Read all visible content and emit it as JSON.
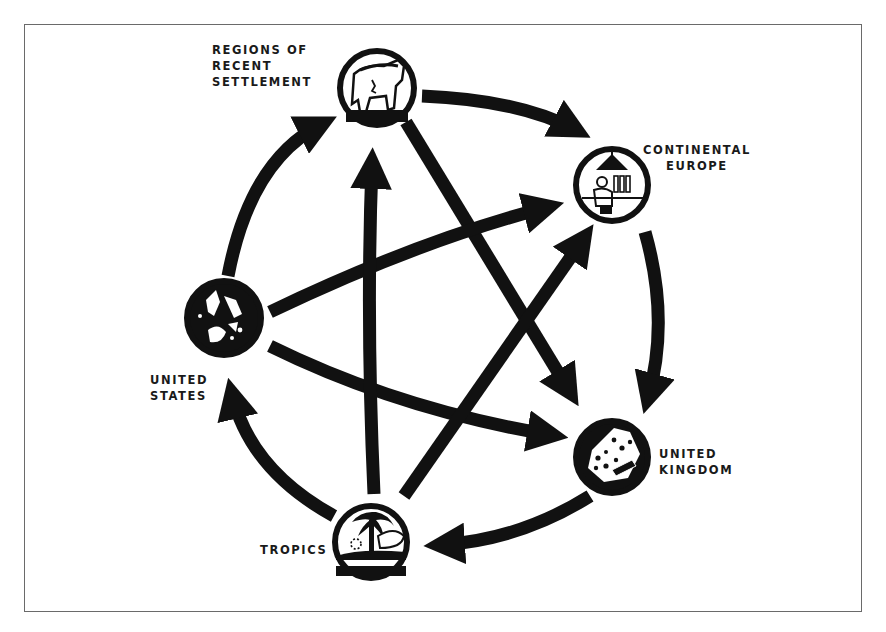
{
  "diagram": {
    "type": "multilateral-trade-flow",
    "colors": {
      "ink": "#111111",
      "frame": "#6a6a6a",
      "background": "#ffffff"
    },
    "nodes": [
      {
        "id": "rrs",
        "lines": [
          "REGIONS OF",
          "RECENT",
          "SETTLEMENT"
        ],
        "icon": "cattle-icon"
      },
      {
        "id": "ce",
        "lines": [
          "CONTINENTAL",
          "EUROPE"
        ],
        "icon": "factory-worker-icon"
      },
      {
        "id": "uk",
        "lines": [
          "UNITED",
          "KINGDOM"
        ],
        "icon": "textiles-icon"
      },
      {
        "id": "tr",
        "lines": [
          "TROPICS"
        ],
        "icon": "palm-tree-icon"
      },
      {
        "id": "us",
        "lines": [
          "UNITED",
          "STATES"
        ],
        "icon": "industry-map-icon"
      }
    ],
    "edges": [
      {
        "from": "rrs",
        "to": "ce",
        "kind": "outer-arc"
      },
      {
        "from": "ce",
        "to": "uk",
        "kind": "outer-arc"
      },
      {
        "from": "uk",
        "to": "tr",
        "kind": "outer-arc"
      },
      {
        "from": "tr",
        "to": "us",
        "kind": "outer-arc"
      },
      {
        "from": "us",
        "to": "rrs",
        "kind": "outer-arc"
      },
      {
        "from": "rrs",
        "to": "uk",
        "kind": "inner-chord"
      },
      {
        "from": "us",
        "to": "ce",
        "kind": "inner-chord"
      },
      {
        "from": "us",
        "to": "uk",
        "kind": "inner-chord"
      },
      {
        "from": "tr",
        "to": "rrs",
        "kind": "inner-chord"
      },
      {
        "from": "tr",
        "to": "ce",
        "kind": "inner-chord"
      }
    ]
  }
}
